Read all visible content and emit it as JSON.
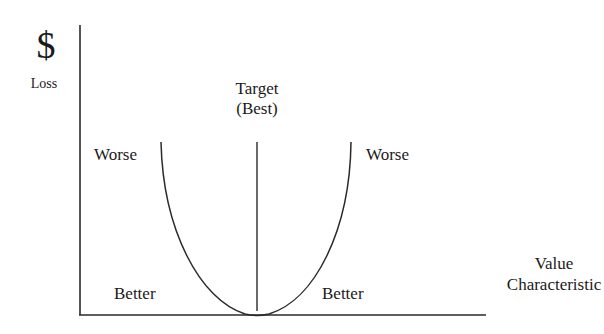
{
  "diagram": {
    "y_axis": {
      "symbol": "$",
      "label": "Loss"
    },
    "x_axis": {
      "label_line1": "Value",
      "label_line2": "Characteristic"
    },
    "target": {
      "line1": "Target",
      "line2": "(Best)"
    },
    "regions": {
      "worse_left": "Worse",
      "worse_right": "Worse",
      "better_left": "Better",
      "better_right": "Better"
    },
    "curve": {
      "type": "parabola",
      "description": "Quadratic loss function with minimum at target"
    },
    "colors": {
      "line": "#2a2a2a",
      "background": "#ffffff",
      "text": "#1a1a1a"
    }
  }
}
